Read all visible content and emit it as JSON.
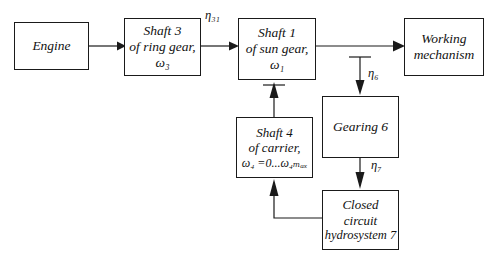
{
  "diagram": {
    "type": "block-diagram",
    "colors": {
      "background": "#ffffff",
      "stroke": "#1a1a1a",
      "text": "#111111"
    },
    "boxes": [
      {
        "id": "engine",
        "name": "engine",
        "lines": [
          "Engine"
        ],
        "x": 14,
        "y": 22,
        "w": 75,
        "h": 48
      },
      {
        "id": "shaft3",
        "name": "shaft-3-ring-gear",
        "lines": [
          "Shaft 3",
          "of ring gear,",
          "ω₃"
        ],
        "x": 124,
        "y": 18,
        "w": 77,
        "h": 58
      },
      {
        "id": "shaft1",
        "name": "shaft-1-sun-gear",
        "lines": [
          "Shaft 1",
          "of sun gear,",
          "ω₁"
        ],
        "x": 238,
        "y": 18,
        "w": 78,
        "h": 62
      },
      {
        "id": "working",
        "name": "working-mechanism",
        "lines": [
          "Working",
          "mechanism"
        ],
        "x": 404,
        "y": 18,
        "w": 80,
        "h": 58
      },
      {
        "id": "shaft4",
        "name": "shaft-4-carrier",
        "lines": [
          "Shaft 4",
          "of carrier,",
          "ω₄ =0...ω₄ₘₐₓ"
        ],
        "x": 236,
        "y": 117,
        "w": 77,
        "h": 61
      },
      {
        "id": "gearing6",
        "name": "gearing-6",
        "lines": [
          "Gearing 6"
        ],
        "x": 322,
        "y": 96,
        "w": 77,
        "h": 62
      },
      {
        "id": "hydrosystem7",
        "name": "closed-circuit-hydrosystem-7",
        "lines": [
          "Closed",
          "circuit",
          "hydrosystem 7"
        ],
        "x": 322,
        "y": 190,
        "w": 77,
        "h": 60
      }
    ],
    "efficiency_labels": [
      {
        "id": "eta31",
        "name": "efficiency-eta-31",
        "text": "η₃₁",
        "x": 205,
        "y": 8
      },
      {
        "id": "eta6",
        "name": "efficiency-eta-6",
        "text": "η₆",
        "x": 368,
        "y": 66
      },
      {
        "id": "eta7",
        "name": "efficiency-eta-7",
        "text": "η₇",
        "x": 371,
        "y": 158
      }
    ],
    "connections": [
      {
        "id": "engine-to-shaft3",
        "name": "link-engine-to-shaft-3",
        "label": ""
      },
      {
        "id": "shaft3-to-shaft1",
        "name": "link-shaft-3-to-shaft-1",
        "label": "η₃₁"
      },
      {
        "id": "shaft1-to-working",
        "name": "link-shaft-1-to-working-mechanism",
        "label": ""
      },
      {
        "id": "branch-to-gearing6",
        "name": "link-branch-to-gearing-6",
        "label": "η₆"
      },
      {
        "id": "gearing6-to-hydrosystem7",
        "name": "link-gearing-6-to-hydrosystem-7",
        "label": "η₇"
      },
      {
        "id": "hydrosystem7-to-shaft4",
        "name": "link-hydrosystem-7-to-shaft-4",
        "label": ""
      },
      {
        "id": "shaft4-to-shaft1",
        "name": "link-shaft-4-to-shaft-1",
        "label": ""
      }
    ]
  }
}
